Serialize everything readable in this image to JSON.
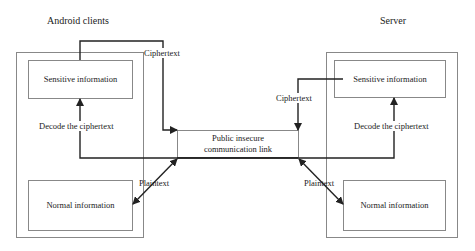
{
  "client": {
    "title": "Android clients",
    "sensitive_label": "Sensitive information",
    "normal_label": "Normal information",
    "decode_label": "Decode the ciphertext"
  },
  "server": {
    "title": "Server",
    "sensitive_label": "Sensitive information",
    "normal_label": "Normal information",
    "decode_label": "Decode the ciphertext"
  },
  "link": {
    "line1": "Public insecure",
    "line2": "communication link"
  },
  "edges": {
    "client_cipher_label": "Ciphertext",
    "server_cipher_label": "Ciphertext",
    "client_plain_label": "Plaintext",
    "server_plain_label": "Plaintext"
  },
  "colors": {
    "box_border": "#888888",
    "arrow": "#222222"
  }
}
